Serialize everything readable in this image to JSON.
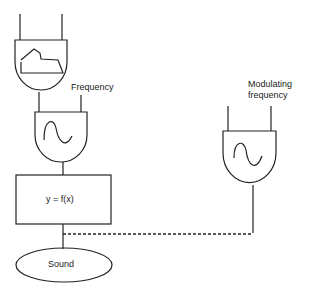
{
  "diagram": {
    "title": "",
    "nodes": {
      "envelope": {
        "type": "envelope-generator"
      },
      "carrier": {
        "type": "oscillator",
        "input_label": "Frequency"
      },
      "modulator": {
        "type": "oscillator",
        "input_label": "Modulating frequency",
        "input_label_line1": "Modulating",
        "input_label_line2": "frequency"
      },
      "waveshaper": {
        "label": "y = f(x)"
      },
      "output": {
        "label": "Sound"
      }
    },
    "edges": [
      {
        "from": "envelope",
        "to": "carrier",
        "style": "solid"
      },
      {
        "from": "carrier",
        "to": "waveshaper",
        "style": "solid"
      },
      {
        "from": "waveshaper",
        "to": "output",
        "style": "solid"
      },
      {
        "from": "modulator",
        "to": "waveshaper-output-line",
        "style": "dashed"
      }
    ],
    "colors": {
      "stroke": "#222222",
      "background": "#ffffff"
    }
  }
}
